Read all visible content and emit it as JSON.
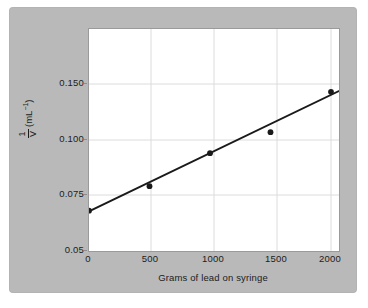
{
  "figure": {
    "panel_color": "#b9b9b9",
    "plot_background": "#ffffff",
    "axis_color": "#9a9a9a",
    "gridline_color": "#dcdcdc",
    "marker_color": "#1a1a1a",
    "line_color": "#1a1a1a"
  },
  "chart_data": {
    "type": "scatter",
    "title": "",
    "subtitle": "",
    "xlabel": "Grams of lead on syringe",
    "ylabel": "1/V (mL⁻¹)",
    "ylabel_parts": {
      "numerator": "1",
      "denominator": "V",
      "units": "(mL",
      "units_exponent": "−1",
      "units_close": ")"
    },
    "grid": true,
    "legend": "none",
    "x": [
      0,
      500,
      1000,
      1500,
      2000
    ],
    "y": [
      0.068,
      0.079,
      0.094,
      0.107,
      0.143
    ],
    "series": [
      {
        "name": "measured",
        "points": [
          {
            "x": 0,
            "y": 0.068
          },
          {
            "x": 500,
            "y": 0.079
          },
          {
            "x": 1000,
            "y": 0.094
          },
          {
            "x": 1500,
            "y": 0.107
          },
          {
            "x": 2000,
            "y": 0.143
          }
        ]
      },
      {
        "name": "best-fit-line",
        "type": "line",
        "endpoints": [
          {
            "x": 0,
            "y": 0.0677
          },
          {
            "x": 2180,
            "y": 0.1497
          }
        ]
      }
    ],
    "xlim": [
      0,
      2180
    ],
    "xticks": [
      0,
      500,
      1000,
      1500,
      2000
    ],
    "xticklabels": [
      "0",
      "500",
      "1000",
      "1500",
      "2000"
    ],
    "yticks": [
      0.05,
      0.075,
      0.1,
      0.15
    ],
    "yticklabels": [
      "0.05",
      "0.075",
      "0.100",
      "0.150"
    ],
    "ylim": [
      0.05,
      0.1565
    ],
    "y_axis_note": "tick labels are spaced evenly though value gaps differ"
  },
  "axes": {
    "y_ticks": [
      {
        "label": "0.150",
        "pixel_y": 83
      },
      {
        "label": "0.100",
        "pixel_y": 139
      },
      {
        "label": "0.075",
        "pixel_y": 194
      },
      {
        "label": "0.05",
        "pixel_y": 250
      }
    ],
    "x_ticks": [
      {
        "label": "0",
        "pixel_x": 88
      },
      {
        "label": "500",
        "pixel_x": 150
      },
      {
        "label": "1000",
        "pixel_x": 213
      },
      {
        "label": "1500",
        "pixel_x": 276
      },
      {
        "label": "2000",
        "pixel_x": 330
      }
    ]
  }
}
